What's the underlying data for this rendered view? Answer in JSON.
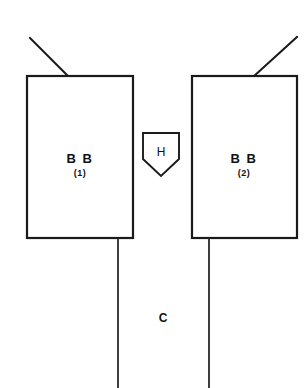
{
  "diagram": {
    "background_color": "#ffffff",
    "line_color": "#1a1a1a",
    "text_color": "#111111",
    "blocks": [
      {
        "id": "bb1",
        "label": "B B",
        "sublabel": "(1)",
        "x": 27,
        "y": 76,
        "width": 106,
        "height": 162,
        "label_cx": 80,
        "label_cy": 158,
        "sublabel_cx": 80,
        "sublabel_cy": 173
      },
      {
        "id": "bb2",
        "label": "B B",
        "sublabel": "(2)",
        "x": 192,
        "y": 76,
        "width": 105,
        "height": 162,
        "label_cx": 244,
        "label_cy": 158,
        "sublabel_cx": 244,
        "sublabel_cy": 173
      }
    ],
    "shield": {
      "id": "h-node",
      "label": "H",
      "label_cx": 161,
      "label_cy": 152,
      "points": "143,133 179,133 179,159 161,176 143,159"
    },
    "feeders": [
      {
        "id": "feeder-left",
        "x1": 30,
        "y1": 38,
        "x2": 68,
        "y2": 76
      },
      {
        "id": "feeder-right",
        "x1": 297,
        "y1": 37,
        "x2": 254,
        "y2": 76
      }
    ],
    "drop_lines": [
      {
        "id": "drop-left",
        "x1": 118,
        "y1": 238,
        "x2": 118,
        "y2": 388
      },
      {
        "id": "drop-right",
        "x1": 209,
        "y1": 238,
        "x2": 209,
        "y2": 388
      }
    ],
    "conductor": {
      "id": "conductor-c",
      "label": "C",
      "label_cx": 163,
      "label_cy": 318
    }
  }
}
